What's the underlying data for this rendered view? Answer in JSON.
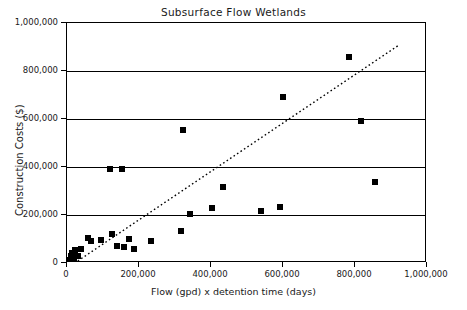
{
  "chart_data": {
    "type": "scatter",
    "title": "Subsurface Flow Wetlands",
    "xlabel": "Flow (gpd) x detention time (days)",
    "ylabel": "Construction Costs ($)",
    "xlim": [
      0,
      1000000
    ],
    "ylim": [
      0,
      1000000
    ],
    "xticks": [
      0,
      200000,
      400000,
      600000,
      800000,
      1000000
    ],
    "xtick_labels": [
      "0",
      "200,000",
      "400,000",
      "600,000",
      "800,000",
      "1,000,000"
    ],
    "yticks": [
      0,
      200000,
      400000,
      600000,
      800000,
      1000000
    ],
    "ytick_labels": [
      "0",
      "200,000",
      "400,000",
      "600,000",
      "800,000",
      "1,000,000"
    ],
    "grid": "horizontal",
    "points": [
      {
        "x": 8000,
        "y": 12000
      },
      {
        "x": 12000,
        "y": 28000
      },
      {
        "x": 15000,
        "y": 42000
      },
      {
        "x": 20000,
        "y": 20000
      },
      {
        "x": 22000,
        "y": 55000
      },
      {
        "x": 30000,
        "y": 30000
      },
      {
        "x": 38000,
        "y": 60000
      },
      {
        "x": 58000,
        "y": 105000
      },
      {
        "x": 66000,
        "y": 92000
      },
      {
        "x": 95000,
        "y": 95000
      },
      {
        "x": 120000,
        "y": 390000
      },
      {
        "x": 125000,
        "y": 120000
      },
      {
        "x": 140000,
        "y": 70000
      },
      {
        "x": 152000,
        "y": 390000
      },
      {
        "x": 158000,
        "y": 65000
      },
      {
        "x": 172000,
        "y": 100000
      },
      {
        "x": 185000,
        "y": 60000
      },
      {
        "x": 232000,
        "y": 90000
      },
      {
        "x": 318000,
        "y": 135000
      },
      {
        "x": 322000,
        "y": 555000
      },
      {
        "x": 342000,
        "y": 205000
      },
      {
        "x": 402000,
        "y": 228000
      },
      {
        "x": 432000,
        "y": 318000
      },
      {
        "x": 538000,
        "y": 215000
      },
      {
        "x": 592000,
        "y": 233000
      },
      {
        "x": 600000,
        "y": 693000
      },
      {
        "x": 782000,
        "y": 857000
      },
      {
        "x": 818000,
        "y": 590000
      },
      {
        "x": 855000,
        "y": 338000
      }
    ],
    "trendline": {
      "style": "dotted",
      "x1": 30000,
      "y1": 0,
      "x2": 925000,
      "y2": 905000
    }
  }
}
